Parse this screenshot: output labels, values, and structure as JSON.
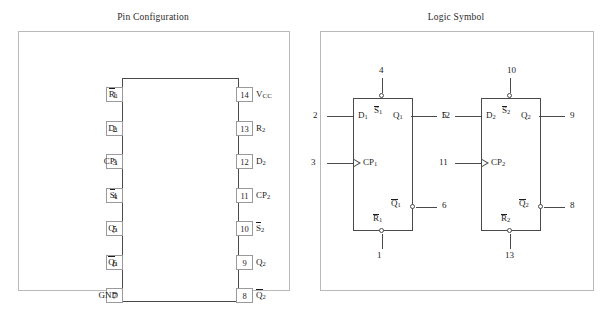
{
  "panels": {
    "pin_configuration": {
      "title": "Pin Configuration",
      "left_pins": [
        {
          "num": "1",
          "label": "R",
          "sub": "1",
          "overline": true,
          "smallcaps": false
        },
        {
          "num": "2",
          "label": "D",
          "sub": "1",
          "overline": false,
          "smallcaps": false
        },
        {
          "num": "3",
          "label": "CP",
          "sub": "1",
          "overline": false,
          "smallcaps": false
        },
        {
          "num": "4",
          "label": "S",
          "sub": "1",
          "overline": true,
          "smallcaps": false
        },
        {
          "num": "5",
          "label": "Q",
          "sub": "1",
          "overline": false,
          "smallcaps": false
        },
        {
          "num": "6",
          "label": "Q",
          "sub": "1",
          "overline": true,
          "smallcaps": false
        },
        {
          "num": "7",
          "label": "GND",
          "sub": "",
          "overline": false,
          "smallcaps": false
        }
      ],
      "right_pins": [
        {
          "num": "14",
          "label": "V",
          "sub": "CC",
          "overline": false,
          "smallcaps": true
        },
        {
          "num": "13",
          "label": "R",
          "sub": "2",
          "overline": false,
          "smallcaps": false
        },
        {
          "num": "12",
          "label": "D",
          "sub": "2",
          "overline": false,
          "smallcaps": false
        },
        {
          "num": "11",
          "label": "CP",
          "sub": "2",
          "overline": false,
          "smallcaps": false
        },
        {
          "num": "10",
          "label": "S",
          "sub": "2",
          "overline": true,
          "smallcaps": false
        },
        {
          "num": "9",
          "label": "Q",
          "sub": "2",
          "overline": false,
          "smallcaps": false
        },
        {
          "num": "8",
          "label": "Q",
          "sub": "2",
          "overline": true,
          "smallcaps": false
        }
      ]
    },
    "logic_symbol": {
      "title": "Logic Symbol",
      "flipflops": [
        {
          "set": {
            "label": "S",
            "sub": "1",
            "overline": true,
            "pin": "4"
          },
          "data": {
            "label": "D",
            "sub": "1",
            "overline": false,
            "pin": "2"
          },
          "clock": {
            "label": "CP",
            "sub": "1",
            "overline": false,
            "pin": "3"
          },
          "q": {
            "label": "Q",
            "sub": "1",
            "overline": false,
            "pin": "5"
          },
          "qbar": {
            "label": "Q",
            "sub": "1",
            "overline": true,
            "pin": "6"
          },
          "reset": {
            "label": "R",
            "sub": "1",
            "overline": true,
            "pin": "1"
          }
        },
        {
          "set": {
            "label": "S",
            "sub": "2",
            "overline": true,
            "pin": "10"
          },
          "data": {
            "label": "D",
            "sub": "2",
            "overline": false,
            "pin": "12"
          },
          "clock": {
            "label": "CP",
            "sub": "2",
            "overline": false,
            "pin": "11"
          },
          "q": {
            "label": "Q",
            "sub": "2",
            "overline": false,
            "pin": "9"
          },
          "qbar": {
            "label": "Q",
            "sub": "2",
            "overline": true,
            "pin": "8"
          },
          "reset": {
            "label": "R",
            "sub": "2",
            "overline": true,
            "pin": "13"
          }
        }
      ]
    }
  },
  "colors": {
    "body_outline": "#4a4a4a",
    "panel_outline": "#b9b9bd",
    "pin_box_outline": "#9a9a9e",
    "text": "#1c1c1c",
    "background": "#ffffff"
  }
}
